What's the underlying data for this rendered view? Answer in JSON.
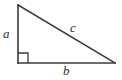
{
  "figure": {
    "kind": "right-triangle-diagram",
    "background_color": "#ffffff",
    "stroke_color": "#3a3a3a",
    "label_color": "#2e2e2e",
    "stroke_width": 1.6
  },
  "geometry": {
    "vertices": {
      "top": {
        "x": 18,
        "y": 5
      },
      "bottom_left": {
        "x": 18,
        "y": 63
      },
      "bottom_right": {
        "x": 115,
        "y": 63
      }
    },
    "right_angle_marker": {
      "at_vertex": "bottom_left",
      "size": 10,
      "points": "18,53 28,53 28,63"
    }
  },
  "labels": {
    "leg_vertical": "a",
    "leg_horizontal": "b",
    "hypotenuse": "c"
  }
}
